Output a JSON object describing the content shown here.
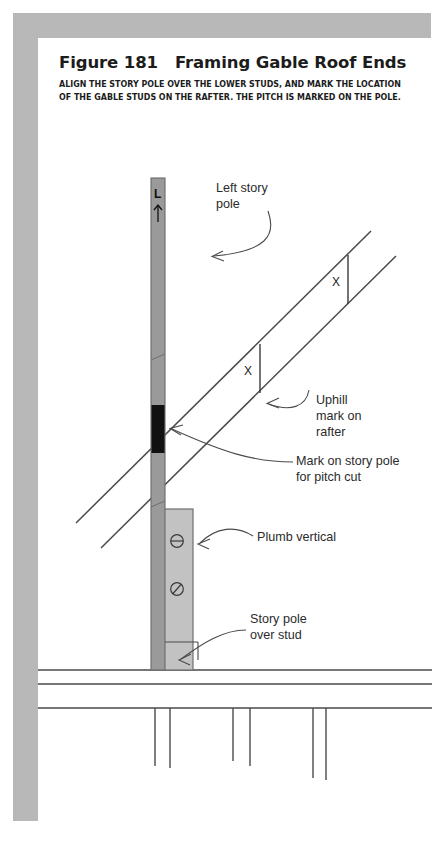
{
  "figure": {
    "title": "Figure 181   Framing Gable Roof Ends",
    "subtitle_line1": "ALIGN THE STORY POLE OVER THE LOWER STUDS, AND MARK THE LOCATION",
    "subtitle_line2": "OF THE GABLE STUDS ON THE RAFTER. THE PITCH IS MARKED ON THE POLE."
  },
  "labels": {
    "left_story_pole": "Left story\npole",
    "uphill_mark": "Uphill\nmark on\nrafter",
    "mark_pitch_cut": "Mark on story pole\nfor pitch cut",
    "plumb_vertical": "Plumb vertical",
    "story_pole_over_stud": "Story pole\nover stud"
  },
  "pole_marks": {
    "top_letter": "L",
    "top_arrow": "↑",
    "circle_mark_upper": "⊖",
    "circle_mark_lower": "⊘"
  },
  "rafter_marks": {
    "upper_x": "X",
    "lower_x": "X"
  },
  "colors": {
    "frame_gray": "#b8b8b8",
    "pole_gray": "#9a9a9a",
    "pole_light_gray": "#bdbdbd",
    "line_dark": "#4a4a4a",
    "mark_black": "#111111",
    "text": "#2b2b2b",
    "page_white": "#ffffff"
  }
}
